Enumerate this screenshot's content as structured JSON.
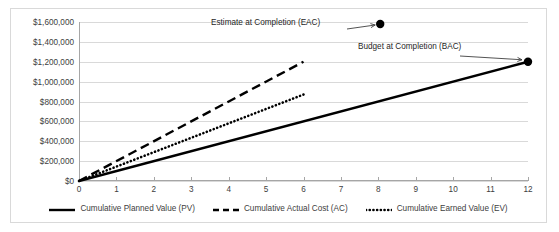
{
  "chart_data": {
    "type": "line",
    "title": "",
    "subtitle": "",
    "xlabel": "",
    "ylabel": "",
    "xlim": [
      0,
      12
    ],
    "ylim": [
      0,
      1600000
    ],
    "grid": true,
    "legend_position": "bottom",
    "x": [
      0,
      1,
      2,
      3,
      4,
      5,
      6,
      7,
      8,
      9,
      10,
      11,
      12
    ],
    "xtick_labels": [
      "0",
      "1",
      "2",
      "3",
      "4",
      "5",
      "6",
      "7",
      "8",
      "9",
      "10",
      "11",
      "12"
    ],
    "ytick_values": [
      0,
      200000,
      400000,
      600000,
      800000,
      1000000,
      1200000,
      1400000,
      1600000
    ],
    "ytick_labels": [
      "$0",
      "$200,000",
      "$400,000",
      "$600,000",
      "$800,000",
      "$1,000,000",
      "$1,200,000",
      "$1,400,000",
      "$1,600,000"
    ],
    "series": [
      {
        "name": "Cumulative Planned Value (PV)",
        "style": "solid",
        "color": "#000000",
        "x": [
          0,
          12
        ],
        "values": [
          0,
          1200000
        ]
      },
      {
        "name": "Cumulative Actual Cost (AC)",
        "style": "dashed",
        "color": "#000000",
        "x": [
          0,
          6
        ],
        "values": [
          0,
          1200000
        ]
      },
      {
        "name": "Cumulative Earned Value (EV)",
        "style": "dotted",
        "color": "#000000",
        "x": [
          0,
          6
        ],
        "values": [
          0,
          870000
        ]
      }
    ],
    "markers": [
      {
        "name": "EAC",
        "x": 8.05,
        "y": 1580000,
        "color": "#000000"
      },
      {
        "name": "BAC",
        "x": 12,
        "y": 1200000,
        "color": "#000000"
      }
    ],
    "annotations": [
      {
        "name": "eac-annotation",
        "text": "Estimate at Completion (EAC)",
        "x": 8.05,
        "y": 1580000
      },
      {
        "name": "bac-annotation",
        "text": "Budget at Completion (BAC)",
        "x": 12,
        "y": 1200000
      }
    ],
    "legend": [
      {
        "label": "Cumulative Planned Value (PV)",
        "style": "solid"
      },
      {
        "label": "Cumulative Actual Cost (AC)",
        "style": "dashed"
      },
      {
        "label": "Cumulative Earned Value (EV)",
        "style": "dotted"
      }
    ],
    "colors": {
      "series": "#000000",
      "gridline": "#d9d9d9",
      "axis": "#a6a6a6",
      "text": "#404040",
      "frame": "#d9d9d9",
      "background": "#ffffff"
    }
  }
}
